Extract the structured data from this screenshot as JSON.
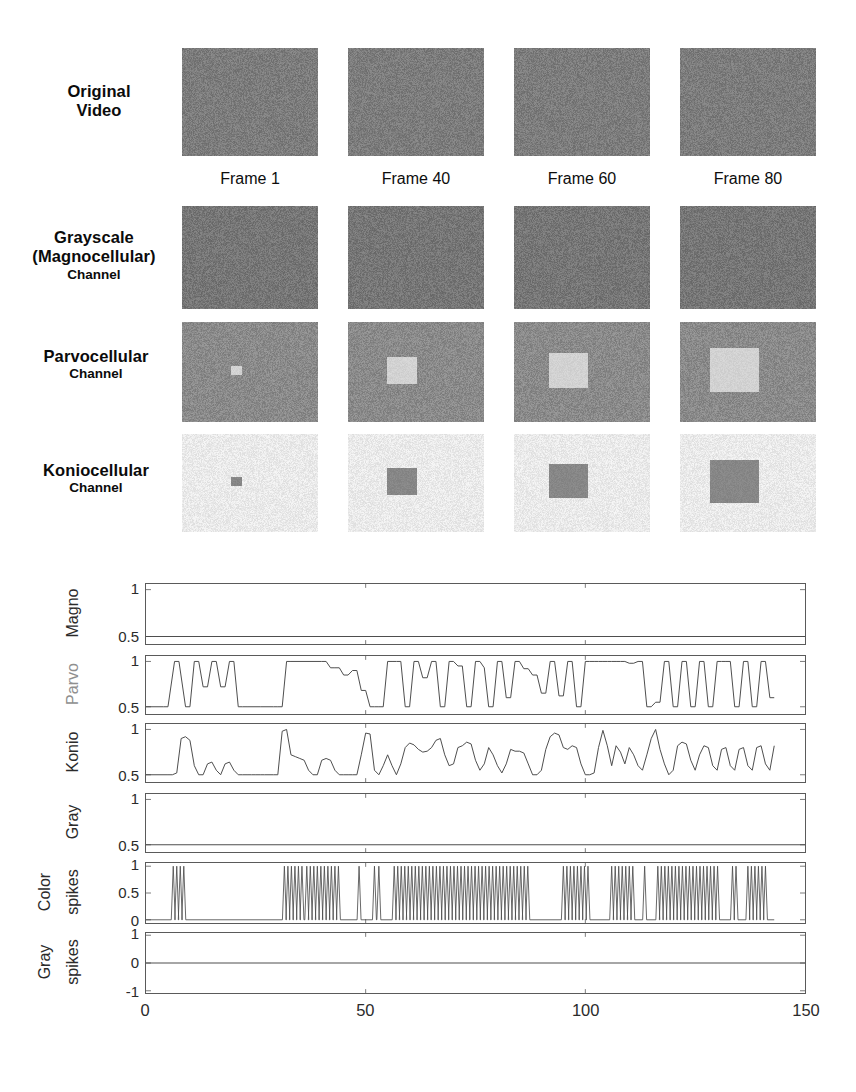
{
  "figure": {
    "caption_rows": [
      "Original Video",
      "Grayscale (Magnocellular) Channel",
      "Parvocellular Channel",
      "Koniocellular Channel"
    ]
  },
  "rows": [
    {
      "id": "original-video",
      "line1": "Original",
      "line2": "Video",
      "line3": "",
      "base_color": "#7c7c7c",
      "patch_color": null
    },
    {
      "id": "grayscale-magnocellular",
      "line1": "Grayscale",
      "line2": "(Magnocellular)",
      "line3": "Channel",
      "base_color": "#767676",
      "patch_color": null
    },
    {
      "id": "parvocellular",
      "line1": "Parvocellular",
      "line2": "",
      "line3": "Channel",
      "base_color": "#8a8a8a",
      "patch_color": "#d2d2d2"
    },
    {
      "id": "koniocellular",
      "line1": "Koniocellular",
      "line2": "",
      "line3": "Channel",
      "base_color": "#eaeaea",
      "patch_color": "#878787"
    }
  ],
  "frames": [
    {
      "label": "Frame 1",
      "patch_scale": 0.09
    },
    {
      "label": "Frame 40",
      "patch_scale": 0.26
    },
    {
      "label": "Frame 60",
      "patch_scale": 0.33
    },
    {
      "label": "Frame 80",
      "patch_scale": 0.42
    }
  ],
  "chart_data": {
    "type": "line",
    "title": "",
    "xlabel": "",
    "xlim": [
      0,
      150
    ],
    "xticks": [
      0,
      50,
      100,
      150
    ],
    "xticklabels": [
      "0",
      "50",
      "100",
      "150"
    ],
    "grid": false,
    "legend": "none",
    "panels": [
      {
        "name": "Magno",
        "ylabel": "Magno",
        "ylim": [
          0.42,
          1.06
        ],
        "yticks": [
          0.5,
          1
        ],
        "yticklabels": [
          "0.5",
          "1"
        ],
        "label_color": "#2b2b2b",
        "x": [
          0,
          150
        ],
        "y": [
          0.5,
          0.5
        ]
      },
      {
        "name": "Parvo",
        "ylabel": "Parvo",
        "ylim": [
          0.42,
          1.06
        ],
        "yticks": [
          0.5,
          1
        ],
        "yticklabels": [
          "0.5",
          "1"
        ],
        "label_color": "#8f8f8f",
        "x": [
          0,
          4,
          5,
          6.5,
          7.5,
          9,
          10,
          11,
          12,
          13,
          14,
          15,
          16,
          17,
          18,
          19,
          20,
          21,
          22,
          23,
          26,
          28,
          29,
          30,
          31,
          32,
          33,
          40,
          41,
          42,
          43,
          44,
          45,
          46,
          47,
          48,
          49,
          50,
          51,
          52,
          53,
          54,
          55,
          56,
          57,
          58,
          59,
          60,
          61,
          62,
          63,
          64,
          65,
          66,
          67,
          68,
          69,
          70,
          71,
          72,
          73,
          74,
          75,
          76,
          77,
          78,
          79,
          80,
          81,
          82,
          83,
          84,
          85,
          86,
          87,
          88,
          89,
          90,
          91,
          92,
          93,
          94,
          95,
          96,
          97,
          98,
          99,
          100,
          101,
          102,
          103,
          104,
          105,
          106,
          107,
          108,
          109,
          110,
          111,
          112,
          113,
          114,
          115,
          116,
          117,
          118,
          119,
          120,
          121,
          122,
          123,
          124,
          125,
          126,
          127,
          128,
          129,
          130,
          131,
          132,
          133,
          134,
          135,
          136,
          137,
          138,
          139,
          140,
          141,
          142,
          143
        ],
        "y": [
          0.5,
          0.5,
          0.5,
          1,
          1,
          0.5,
          0.5,
          1,
          1,
          0.72,
          0.72,
          1,
          1,
          0.72,
          0.72,
          1,
          1,
          0.5,
          0.5,
          0.5,
          0.5,
          0.5,
          0.5,
          0.5,
          0.5,
          1,
          1,
          1,
          1,
          0.93,
          0.93,
          0.93,
          0.85,
          0.85,
          0.9,
          0.9,
          0.68,
          0.68,
          0.5,
          0.5,
          0.5,
          0.5,
          1,
          1,
          1,
          1,
          0.5,
          0.5,
          1,
          1,
          0.82,
          0.82,
          1,
          1,
          0.5,
          0.5,
          1,
          1,
          0.95,
          0.95,
          0.5,
          0.5,
          1,
          1,
          0.93,
          0.5,
          0.5,
          1,
          1,
          0.6,
          0.6,
          1,
          1,
          0.92,
          0.92,
          0.85,
          0.85,
          0.65,
          0.65,
          1,
          1,
          0.62,
          0.62,
          1,
          1,
          0.5,
          0.5,
          1,
          1,
          1,
          1,
          1,
          1,
          1,
          1,
          1,
          1,
          0.98,
          0.98,
          1,
          1,
          0.5,
          0.5,
          0.55,
          0.55,
          1,
          1,
          0.5,
          0.5,
          1,
          1,
          0.5,
          0.5,
          1,
          1,
          0.5,
          0.5,
          1,
          1,
          1,
          1,
          0.5,
          0.5,
          1,
          1,
          0.5,
          0.5,
          1,
          1,
          0.6,
          0.6,
          1,
          1,
          0.5,
          0.5,
          1,
          1,
          0.5,
          0.5,
          1,
          1,
          0.5,
          0.5,
          1,
          0.5
        ]
      },
      {
        "name": "Konio",
        "ylabel": "Konio",
        "ylim": [
          0.42,
          1.06
        ],
        "yticks": [
          0.5,
          1
        ],
        "yticklabels": [
          "0.5",
          "1"
        ],
        "label_color": "#2b2b2b",
        "x": [
          0,
          5,
          6,
          7,
          8,
          9,
          10,
          11,
          12,
          13,
          14,
          15,
          16,
          17,
          18,
          19,
          20,
          21,
          22,
          23,
          24,
          25,
          26,
          27,
          28,
          29,
          30,
          31,
          32,
          33,
          34,
          35,
          36,
          37,
          38,
          39,
          40,
          41,
          42,
          43,
          44,
          45,
          46,
          47,
          48,
          49,
          50,
          51,
          52,
          53,
          54,
          55,
          56,
          57,
          58,
          59,
          60,
          61,
          62,
          63,
          64,
          65,
          66,
          67,
          68,
          69,
          70,
          71,
          72,
          73,
          74,
          75,
          76,
          77,
          78,
          79,
          80,
          81,
          82,
          83,
          84,
          85,
          86,
          87,
          88,
          89,
          90,
          91,
          92,
          93,
          94,
          95,
          96,
          97,
          98,
          99,
          100,
          101,
          102,
          103,
          104,
          105,
          106,
          107,
          108,
          109,
          110,
          111,
          112,
          113,
          114,
          115,
          116,
          117,
          118,
          119,
          120,
          121,
          122,
          123,
          124,
          125,
          126,
          127,
          128,
          129,
          130,
          131,
          132,
          133,
          134,
          135,
          136,
          137,
          138,
          139,
          140,
          141,
          142,
          143
        ],
        "y": [
          0.5,
          0.5,
          0.5,
          0.52,
          0.9,
          0.92,
          0.88,
          0.6,
          0.5,
          0.5,
          0.62,
          0.64,
          0.55,
          0.5,
          0.62,
          0.64,
          0.55,
          0.5,
          0.5,
          0.5,
          0.5,
          0.5,
          0.5,
          0.5,
          0.5,
          0.5,
          0.5,
          0.98,
          1,
          0.72,
          0.7,
          0.68,
          0.66,
          0.55,
          0.5,
          0.5,
          0.66,
          0.68,
          0.66,
          0.55,
          0.5,
          0.5,
          0.5,
          0.5,
          0.5,
          0.72,
          0.96,
          0.95,
          0.55,
          0.5,
          0.6,
          0.72,
          0.6,
          0.5,
          0.62,
          0.8,
          0.85,
          0.83,
          0.78,
          0.75,
          0.76,
          0.8,
          0.88,
          0.9,
          0.72,
          0.6,
          0.62,
          0.8,
          0.82,
          0.86,
          0.84,
          0.66,
          0.55,
          0.62,
          0.8,
          0.72,
          0.6,
          0.52,
          0.62,
          0.78,
          0.76,
          0.76,
          0.74,
          0.62,
          0.5,
          0.5,
          0.55,
          0.78,
          0.92,
          0.96,
          0.94,
          0.8,
          0.78,
          0.82,
          0.8,
          0.62,
          0.5,
          0.5,
          0.52,
          0.8,
          0.99,
          0.82,
          0.6,
          0.82,
          0.75,
          0.62,
          0.8,
          0.72,
          0.6,
          0.55,
          0.72,
          0.9,
          1,
          0.78,
          0.62,
          0.5,
          0.55,
          0.82,
          0.86,
          0.84,
          0.66,
          0.55,
          0.72,
          0.82,
          0.8,
          0.6,
          0.55,
          0.78,
          0.8,
          0.6,
          0.55,
          0.78,
          0.8,
          0.6,
          0.55,
          0.8,
          0.82,
          0.62,
          0.55,
          0.82,
          0.88
        ]
      },
      {
        "name": "Gray",
        "ylabel": "Gray",
        "ylim": [
          0.42,
          1.06
        ],
        "yticks": [
          0.5,
          1
        ],
        "yticklabels": [
          "0.5",
          "1"
        ],
        "label_color": "#2b2b2b",
        "x": [
          0,
          150
        ],
        "y": [
          0.5,
          0.5
        ]
      },
      {
        "name": "Color spikes",
        "ylabel": "Color spikes",
        "ylim": [
          -0.06,
          1.06
        ],
        "yticks": [
          0,
          0.5,
          1
        ],
        "yticklabels": [
          "0",
          "0.5",
          "1"
        ],
        "label_color": "#2b2b2b",
        "spike_times": [
          6.2,
          7.0,
          7.8,
          8.6,
          31.5,
          32.3,
          33.1,
          33.9,
          34.7,
          35.5,
          36.6,
          37.4,
          38.2,
          39.0,
          39.8,
          40.6,
          41.4,
          42.2,
          43.0,
          43.8,
          48.5,
          52.0,
          53.0,
          56.5,
          57.3,
          58.1,
          58.9,
          59.7,
          60.5,
          61.3,
          62.1,
          62.9,
          63.7,
          64.5,
          65.3,
          66.1,
          66.9,
          67.7,
          68.5,
          69.3,
          70.1,
          70.9,
          71.7,
          72.5,
          73.3,
          74.1,
          74.9,
          75.7,
          76.5,
          77.3,
          78.1,
          78.9,
          79.7,
          80.5,
          81.3,
          82.1,
          82.9,
          83.7,
          84.5,
          85.3,
          86.1,
          86.9,
          95.0,
          95.8,
          96.6,
          97.4,
          98.2,
          99.0,
          99.8,
          100.6,
          106.0,
          106.8,
          107.6,
          108.4,
          109.2,
          110.0,
          110.8,
          113.5,
          116.5,
          117.3,
          118.1,
          118.9,
          119.7,
          120.5,
          121.3,
          122.1,
          122.9,
          123.7,
          124.5,
          125.3,
          126.1,
          126.9,
          127.7,
          128.5,
          129.3,
          130.1,
          133.5,
          134.3,
          137.0,
          137.8,
          138.6,
          139.4,
          140.2,
          141.0
        ]
      },
      {
        "name": "Gray spikes",
        "ylabel": "Gray spikes",
        "ylim": [
          -1.08,
          1.08
        ],
        "yticks": [
          -1,
          0,
          1
        ],
        "yticklabels": [
          "-1",
          "0",
          "1"
        ],
        "label_color": "#2b2b2b",
        "x": [
          0,
          150
        ],
        "y": [
          0,
          0
        ]
      }
    ]
  }
}
